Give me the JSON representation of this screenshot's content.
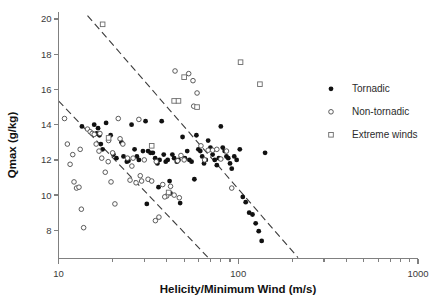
{
  "chart_data": {
    "type": "scatter",
    "title": "",
    "xlabel": "Helicity/Minimum Wind (m/s)",
    "ylabel": "Qmax (g/kg)",
    "xscale": "log",
    "yscale": "linear",
    "xlim": [
      10,
      1000
    ],
    "ylim": [
      6.4,
      20.4
    ],
    "grid": false,
    "x_tick_labels": [
      "10",
      "100",
      "1000"
    ],
    "x_tick_values": [
      10,
      100,
      1000
    ],
    "y_tick_labels": [
      "8",
      "10",
      "12",
      "14",
      "16",
      "18",
      "20"
    ],
    "y_tick_values": [
      8,
      10,
      12,
      14,
      16,
      18,
      20
    ],
    "legend_position": "right",
    "series": [
      {
        "name": "Tornadic",
        "marker": "filled-circle",
        "color": "#111111",
        "points": [
          [
            13.5,
            13.9
          ],
          [
            15.8,
            14.0
          ],
          [
            16.6,
            13.8
          ],
          [
            16.3,
            13.5
          ],
          [
            16.9,
            13.4
          ],
          [
            17.2,
            12.9
          ],
          [
            17.6,
            12.6
          ],
          [
            18.4,
            14.1
          ],
          [
            19.5,
            13.4
          ],
          [
            20.2,
            12.3
          ],
          [
            21.0,
            12.1
          ],
          [
            22.4,
            13.0
          ],
          [
            23.0,
            12.2
          ],
          [
            24.0,
            11.9
          ],
          [
            25.5,
            14.0
          ],
          [
            26.5,
            12.6
          ],
          [
            27.3,
            12.2
          ],
          [
            28.0,
            12.0
          ],
          [
            29.5,
            12.5
          ],
          [
            30.5,
            14.2
          ],
          [
            31.5,
            12.5
          ],
          [
            32.5,
            12.4
          ],
          [
            33.5,
            12.4
          ],
          [
            34.5,
            12.1
          ],
          [
            35.5,
            11.8
          ],
          [
            36.5,
            12.0
          ],
          [
            37.5,
            14.2
          ],
          [
            38.5,
            12.3
          ],
          [
            39.5,
            11.9
          ],
          [
            40.5,
            12.0
          ],
          [
            41.5,
            10.8
          ],
          [
            43.0,
            12.3
          ],
          [
            44.0,
            12.1
          ],
          [
            45.5,
            11.9
          ],
          [
            46.5,
            12.0
          ],
          [
            47.5,
            9.55
          ],
          [
            49.0,
            13.3
          ],
          [
            50.5,
            12.1
          ],
          [
            52.0,
            12.5
          ],
          [
            53.5,
            12.0
          ],
          [
            55.0,
            11.9
          ],
          [
            57.0,
            10.9
          ],
          [
            58.5,
            13.4
          ],
          [
            60.0,
            12.6
          ],
          [
            61.5,
            12.5
          ],
          [
            63.0,
            12.2
          ],
          [
            64.5,
            11.8
          ],
          [
            66.0,
            12.0
          ],
          [
            68.0,
            13.1
          ],
          [
            70.0,
            12.7
          ],
          [
            72.0,
            12.3
          ],
          [
            74.0,
            12.0
          ],
          [
            76.0,
            11.7
          ],
          [
            78.0,
            12.1
          ],
          [
            80.0,
            13.9
          ],
          [
            82.0,
            12.7
          ],
          [
            84.0,
            12.5
          ],
          [
            86.0,
            12.2
          ],
          [
            88.0,
            12.1
          ],
          [
            90.0,
            11.8
          ],
          [
            92.0,
            11.5
          ],
          [
            95.0,
            12.2
          ],
          [
            98.0,
            12.0
          ],
          [
            102.0,
            12.6
          ],
          [
            106.0,
            9.9
          ],
          [
            110.0,
            9.6
          ],
          [
            115.0,
            9.0
          ],
          [
            120.0,
            8.9
          ],
          [
            125.0,
            8.4
          ],
          [
            130.0,
            7.95
          ],
          [
            135.0,
            7.4
          ],
          [
            141.0,
            12.4
          ],
          [
            36.0,
            10.45
          ],
          [
            42.0,
            10.1
          ],
          [
            31.0,
            9.5
          ],
          [
            24.5,
            11.95
          ]
        ]
      },
      {
        "name": "Non-tornadic",
        "marker": "open-circle",
        "color": "#4a4a4a",
        "points": [
          [
            10.8,
            14.35
          ],
          [
            11.6,
            11.75
          ],
          [
            12.2,
            10.75
          ],
          [
            12.6,
            10.4
          ],
          [
            13.0,
            10.45
          ],
          [
            13.4,
            9.2
          ],
          [
            13.8,
            8.15
          ],
          [
            14.5,
            13.75
          ],
          [
            15.0,
            13.6
          ],
          [
            15.4,
            13.5
          ],
          [
            15.8,
            13.45
          ],
          [
            16.2,
            12.9
          ],
          [
            16.8,
            12.5
          ],
          [
            17.4,
            12.1
          ],
          [
            18.2,
            11.3
          ],
          [
            18.9,
            11.9
          ],
          [
            19.6,
            10.75
          ],
          [
            20.6,
            9.5
          ],
          [
            21.5,
            14.35
          ],
          [
            22.8,
            12.9
          ],
          [
            24.2,
            12.1
          ],
          [
            25.6,
            11.65
          ],
          [
            27.0,
            10.7
          ],
          [
            28.5,
            11.1
          ],
          [
            30.0,
            12.0
          ],
          [
            31.5,
            10.9
          ],
          [
            33.0,
            10.8
          ],
          [
            34.6,
            8.55
          ],
          [
            36.2,
            8.75
          ],
          [
            38.0,
            10.6
          ],
          [
            40.0,
            9.95
          ],
          [
            42.0,
            10.5
          ],
          [
            44.0,
            10.0
          ],
          [
            46.0,
            11.95
          ],
          [
            48.0,
            12.25
          ],
          [
            50.0,
            12.0
          ],
          [
            53.0,
            16.9
          ],
          [
            56.0,
            16.5
          ],
          [
            59.0,
            15.8
          ],
          [
            62.0,
            12.8
          ],
          [
            65.0,
            12.0
          ],
          [
            68.0,
            12.55
          ],
          [
            72.0,
            12.55
          ],
          [
            76.0,
            12.6
          ],
          [
            80.0,
            12.05
          ],
          [
            86.0,
            12.5
          ],
          [
            92.0,
            10.4
          ],
          [
            44.5,
            17.05
          ],
          [
            28.0,
            14.3
          ],
          [
            22.0,
            13.2
          ],
          [
            19.0,
            13.1
          ],
          [
            20.0,
            12.4
          ],
          [
            12.0,
            12.3
          ],
          [
            11.2,
            12.9
          ],
          [
            13.2,
            12.6
          ],
          [
            17.0,
            13.5
          ],
          [
            26.0,
            12.1
          ],
          [
            35.0,
            11.9
          ],
          [
            56.5,
            15.05
          ],
          [
            47.0,
            9.85
          ],
          [
            39.0,
            9.9
          ],
          [
            29.0,
            10.8
          ],
          [
            25.0,
            10.85
          ]
        ]
      },
      {
        "name": "Extreme winds",
        "marker": "open-square",
        "color": "#6a6a6a",
        "points": [
          [
            17.6,
            19.7
          ],
          [
            50.0,
            16.7
          ],
          [
            44.0,
            15.35
          ],
          [
            46.5,
            15.35
          ],
          [
            59.0,
            15.0
          ],
          [
            103.0,
            17.55
          ],
          [
            132.0,
            16.3
          ],
          [
            19.0,
            13.25
          ],
          [
            41.0,
            10.15
          ],
          [
            33.0,
            12.8
          ]
        ]
      }
    ],
    "annotations": {
      "trend_lines": [
        {
          "name": "upper-envelope",
          "style": "dashed",
          "x1": 14.5,
          "y1": 20.2,
          "x2": 215.0,
          "y2": 6.45
        },
        {
          "name": "lower-envelope",
          "style": "dashed",
          "x1": 10.0,
          "y1": 15.35,
          "x2": 68.0,
          "y2": 6.45
        }
      ]
    }
  },
  "legend": {
    "items": [
      {
        "label": "Tornadic",
        "marker": "filled-circle"
      },
      {
        "label": "Non-tornadic",
        "marker": "open-circle"
      },
      {
        "label": "Extreme winds",
        "marker": "open-square"
      }
    ]
  },
  "axes": {
    "x_title": "Helicity/Minimum Wind (m/s)",
    "y_title": "Qmax (g/kg)"
  }
}
